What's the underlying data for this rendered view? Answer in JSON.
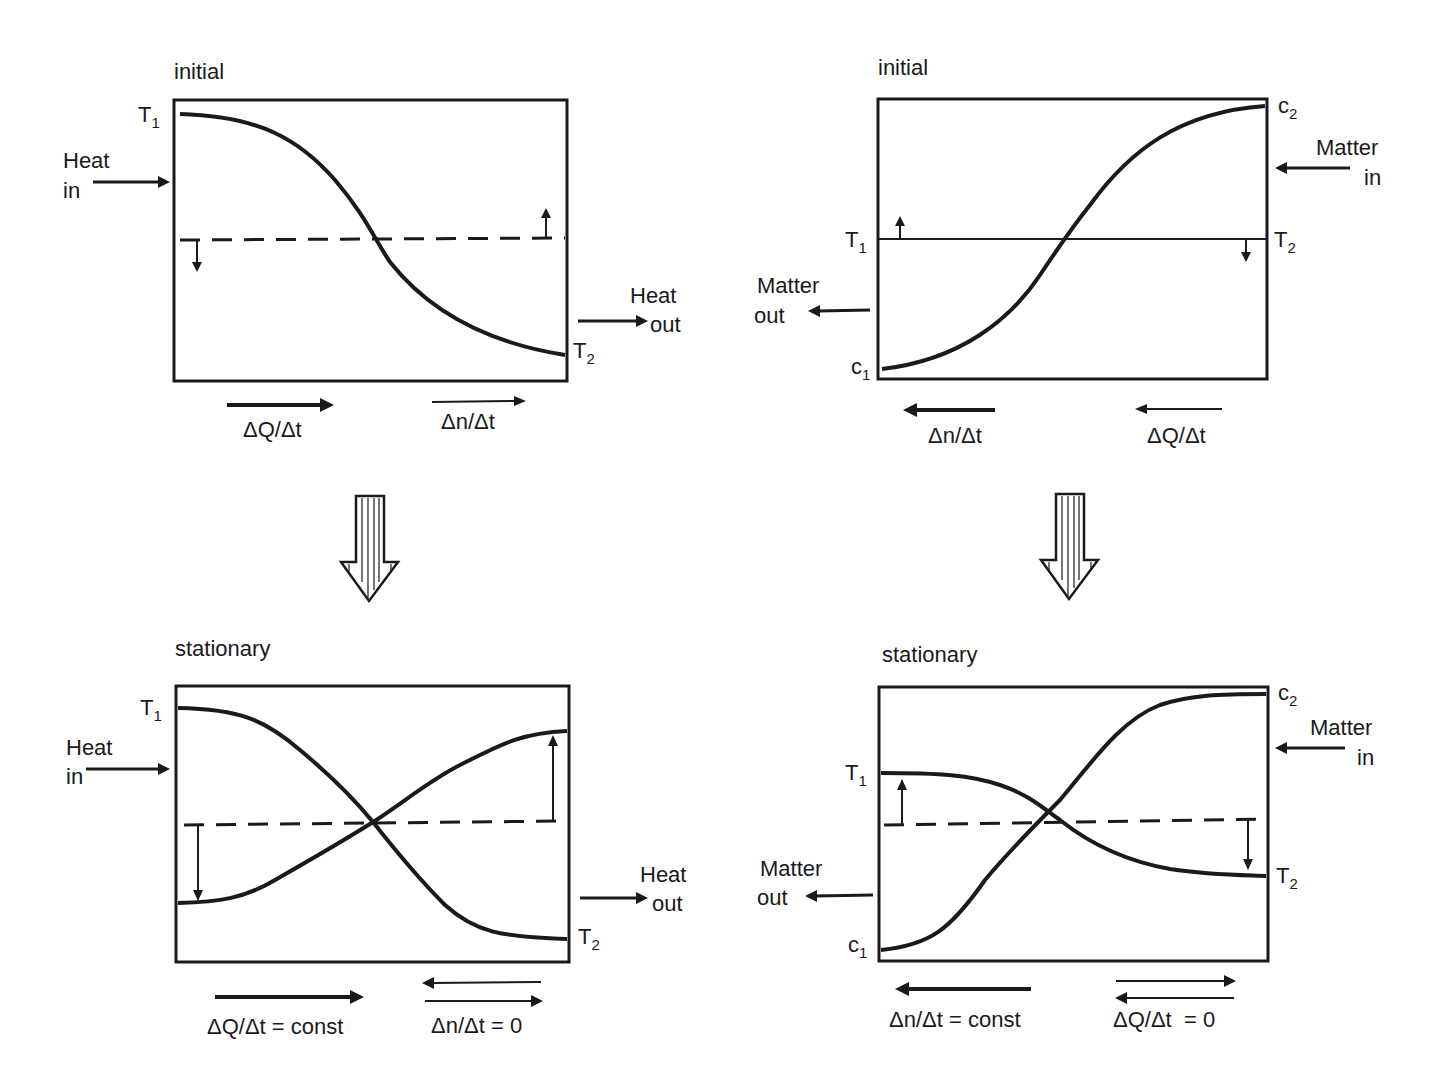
{
  "panels": {
    "top_left": {
      "title": "initial",
      "labels": {
        "T1": "T",
        "T1_sub": "1",
        "T2": "T",
        "T2_sub": "2",
        "heat_in_1": "Heat",
        "heat_in_2": "in",
        "heat_out_1": "Heat",
        "heat_out_2": "out",
        "flow_1": "ΔQ/Δt",
        "flow_2": "Δn/Δt"
      }
    },
    "top_right": {
      "title": "initial",
      "labels": {
        "c2": "c",
        "c2_sub": "2",
        "c1": "c",
        "c1_sub": "1",
        "T1": "T",
        "T1_sub": "1",
        "T2": "T",
        "T2_sub": "2",
        "matter_in_1": "Matter",
        "matter_in_2": "in",
        "matter_out_1": "Matter",
        "matter_out_2": "out",
        "flow_1": "Δn/Δt",
        "flow_2": "ΔQ/Δt"
      }
    },
    "bottom_left": {
      "title": "stationary",
      "labels": {
        "T1": "T",
        "T1_sub": "1",
        "T2": "T",
        "T2_sub": "2",
        "heat_in_1": "Heat",
        "heat_in_2": "in",
        "heat_out_1": "Heat",
        "heat_out_2": "out",
        "flow_1": "ΔQ/Δt = const",
        "flow_2": "Δn/Δt = 0"
      }
    },
    "bottom_right": {
      "title": "stationary",
      "labels": {
        "c2": "c",
        "c2_sub": "2",
        "c1": "c",
        "c1_sub": "1",
        "T1": "T",
        "T1_sub": "1",
        "T2": "T",
        "T2_sub": "2",
        "matter_in_1": "Matter",
        "matter_in_2": "in",
        "matter_out_1": "Matter",
        "matter_out_2": "out",
        "flow_1": "Δn/Δt = const",
        "flow_2": "ΔQ/Δt  = 0"
      }
    }
  },
  "transition_arrows": [
    "initial-to-stationary-left",
    "initial-to-stationary-right"
  ]
}
